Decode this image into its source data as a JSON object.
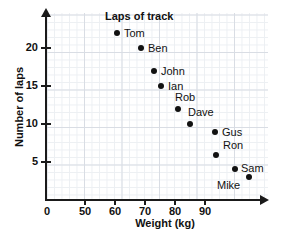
{
  "chart_data": {
    "type": "scatter",
    "title": "Laps of track",
    "xlabel": "Weight (kg)",
    "ylabel": "Number of laps",
    "xlim": [
      45,
      98
    ],
    "ylim": [
      0,
      24
    ],
    "grid": true,
    "legend": "none",
    "x_ticks": [
      {
        "value": 0,
        "label": "0"
      },
      {
        "value": 50,
        "label": "50"
      },
      {
        "value": 60,
        "label": "60"
      },
      {
        "value": 70,
        "label": "70"
      },
      {
        "value": 80,
        "label": "80"
      },
      {
        "value": 90,
        "label": "90"
      }
    ],
    "y_ticks": [
      {
        "value": 5,
        "label": "5"
      },
      {
        "value": 10,
        "label": "10"
      },
      {
        "value": 15,
        "label": "15"
      },
      {
        "value": 20,
        "label": "20"
      }
    ],
    "point_color": "#111111",
    "grid_color": "#d9dde4",
    "axis_color": "#1a1a1a",
    "points": [
      {
        "name": "Tom",
        "x": 60,
        "y": 22,
        "px": 117,
        "py": 33,
        "label_dx": 7,
        "label_dy": -5
      },
      {
        "name": "Ben",
        "x": 65,
        "y": 20,
        "px": 141,
        "py": 48,
        "label_dx": 7,
        "label_dy": -5
      },
      {
        "name": "John",
        "x": 68,
        "y": 17,
        "px": 154,
        "py": 71,
        "label_dx": 7,
        "label_dy": -5
      },
      {
        "name": "Ian",
        "x": 70,
        "y": 15,
        "px": 161,
        "py": 86,
        "label_dx": 7,
        "label_dy": -5
      },
      {
        "name": "Rob",
        "x": 75,
        "y": 12,
        "px": 178,
        "py": 109,
        "label_dx": -3,
        "label_dy": -17
      },
      {
        "name": "Dave",
        "x": 78,
        "y": 10,
        "px": 190,
        "py": 124,
        "label_dx": -2,
        "label_dy": -17
      },
      {
        "name": "Gus",
        "x": 85,
        "y": 9,
        "px": 215,
        "py": 132,
        "label_dx": 7,
        "label_dy": -5
      },
      {
        "name": "Ron",
        "x": 85,
        "y": 6,
        "px": 216,
        "py": 155,
        "label_dx": 7,
        "label_dy": -15
      },
      {
        "name": "Sam",
        "x": 90,
        "y": 4,
        "px": 235,
        "py": 169,
        "label_dx": 6,
        "label_dy": -6
      },
      {
        "name": "Mike",
        "x": 94,
        "y": 3,
        "px": 249,
        "py": 177,
        "label_dx": -32,
        "label_dy": 3
      }
    ]
  }
}
